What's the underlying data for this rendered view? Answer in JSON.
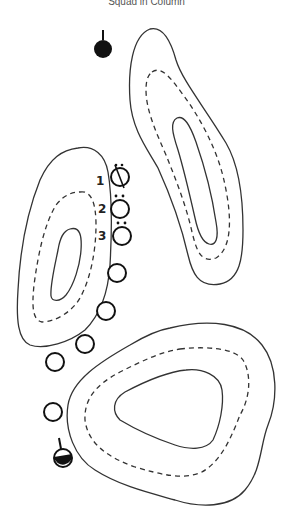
{
  "title": "Squad in Column",
  "colors": {
    "line": "#333333",
    "soldier": "#111111",
    "background": "#ffffff"
  },
  "legend": {
    "squad_leader_icon": "filled-circle-with-antenna",
    "rear_element_icon": "half-filled-circle-with-antenna",
    "soldier_icon": "open-circle"
  },
  "labels": {
    "n1": "1",
    "n2": "2",
    "n3": "3"
  },
  "terrain": [
    {
      "name": "hill-upper-right",
      "contours": [
        "solid-outer",
        "dashed-middle",
        "solid-inner"
      ]
    },
    {
      "name": "hill-left",
      "contours": [
        "solid-outer",
        "dashed-middle",
        "solid-inner"
      ]
    },
    {
      "name": "hill-lower-right",
      "contours": [
        "solid-outer",
        "dashed-middle",
        "solid-inner"
      ]
    }
  ],
  "formation": {
    "lead_element": {
      "x": 103,
      "y": 49,
      "type": "filled"
    },
    "soldiers": [
      {
        "label": "1",
        "x": 120,
        "y": 177,
        "marking": "slash-with-dots"
      },
      {
        "label": "2",
        "x": 120,
        "y": 209,
        "marking": "two-dots"
      },
      {
        "label": "3",
        "x": 122,
        "y": 236,
        "marking": "two-dots"
      },
      {
        "label": "",
        "x": 117,
        "y": 273,
        "marking": "none"
      },
      {
        "label": "",
        "x": 106,
        "y": 311,
        "marking": "none"
      },
      {
        "label": "",
        "x": 85,
        "y": 344,
        "marking": "none"
      },
      {
        "label": "",
        "x": 55,
        "y": 362,
        "marking": "none"
      },
      {
        "label": "",
        "x": 53,
        "y": 412,
        "marking": "none"
      }
    ],
    "rear_element": {
      "x": 63,
      "y": 458,
      "type": "half-filled"
    }
  }
}
